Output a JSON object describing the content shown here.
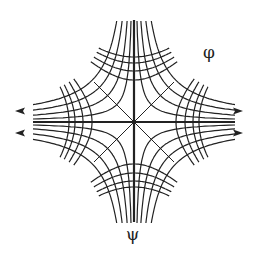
{
  "diagram": {
    "type": "flow-net",
    "center": [
      134,
      122
    ],
    "line_color": "#222222",
    "background": "#ffffff",
    "labels": {
      "phi": {
        "text": "φ",
        "x": 203,
        "y": 44
      },
      "psi": {
        "text": "ψ",
        "x": 126,
        "y": 226
      }
    },
    "psi_family": {
      "equation": "xy = c",
      "constants": [
        300,
        700,
        1200,
        1750
      ]
    },
    "phi_family": {
      "equation": "x^2 - y^2 = c",
      "vertex_distances": [
        42,
        51,
        59,
        65
      ]
    },
    "axes": [
      "horizontal",
      "vertical",
      "diagonal",
      "anti-diagonal"
    ],
    "arrows": [
      {
        "x": 20,
        "y": 111,
        "direction": "left"
      },
      {
        "x": 20,
        "y": 133,
        "direction": "left"
      },
      {
        "x": 238,
        "y": 111,
        "direction": "right"
      },
      {
        "x": 238,
        "y": 133,
        "direction": "right"
      }
    ]
  }
}
